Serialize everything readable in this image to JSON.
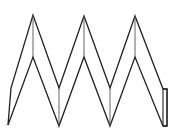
{
  "diagram": {
    "title": "",
    "stroke_color": "#222222",
    "fold_line_color": "#555555",
    "background": "#ffffff",
    "outer_outline": [
      [
        8,
        125
      ],
      [
        11,
        88
      ],
      [
        33,
        15
      ],
      [
        59,
        88
      ],
      [
        84,
        16
      ],
      [
        110,
        88
      ],
      [
        135,
        16
      ],
      [
        163,
        89
      ],
      [
        167,
        89
      ],
      [
        167,
        126
      ],
      [
        163,
        126
      ]
    ],
    "inner_outline": [
      [
        8,
        125
      ],
      [
        33,
        57
      ],
      [
        59,
        126
      ],
      [
        84,
        57
      ],
      [
        110,
        126
      ],
      [
        135,
        57
      ],
      [
        163,
        126
      ]
    ],
    "fold_lines": [
      [
        [
          33,
          15
        ],
        [
          33,
          57
        ]
      ],
      [
        [
          59,
          88
        ],
        [
          59,
          126
        ]
      ],
      [
        [
          84,
          16
        ],
        [
          84,
          57
        ]
      ],
      [
        [
          110,
          88
        ],
        [
          110,
          126
        ]
      ],
      [
        [
          135,
          16
        ],
        [
          135,
          57
        ]
      ]
    ],
    "end_tab": {
      "x": 163,
      "y": 89,
      "width": 4,
      "height": 37
    }
  }
}
